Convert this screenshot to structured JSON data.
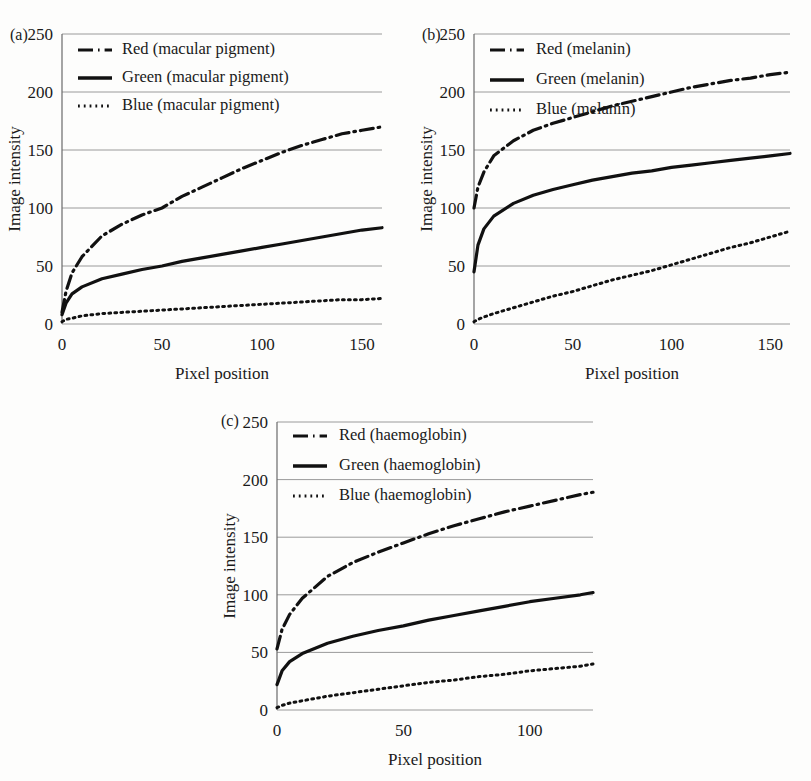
{
  "figure": {
    "background": "#fdfdfc",
    "ink": "#111111",
    "gridline_color": "#9a9a9a"
  },
  "panels": [
    {
      "id": "a",
      "label": "(a)",
      "xlabel": "Pixel position",
      "ylabel": "Image intensity",
      "yticks": [
        0,
        50,
        100,
        150,
        200,
        250
      ],
      "xticks": [
        0,
        50,
        100,
        150
      ],
      "legend": [
        {
          "label": "Red (macular pigment)",
          "style": "dashdot"
        },
        {
          "label": "Green (macular pigment)",
          "style": "solid"
        },
        {
          "label": "Blue (macular pigment)",
          "style": "dotted"
        }
      ]
    },
    {
      "id": "b",
      "label": "(b)",
      "xlabel": "Pixel position",
      "ylabel": "Image intensity",
      "yticks": [
        0,
        50,
        100,
        150,
        200,
        250
      ],
      "xticks": [
        0,
        50,
        100,
        150
      ],
      "legend": [
        {
          "label": "Red (melanin)",
          "style": "dashdot"
        },
        {
          "label": "Green (melanin)",
          "style": "solid"
        },
        {
          "label": "Blue (melanin)",
          "style": "dotted"
        }
      ]
    },
    {
      "id": "c",
      "label": "(c)",
      "xlabel": "Pixel position",
      "ylabel": "Image intensity",
      "yticks": [
        0,
        50,
        100,
        150,
        200,
        250
      ],
      "xticks": [
        0,
        50,
        100
      ],
      "legend": [
        {
          "label": "Red (haemoglobin)",
          "style": "dashdot"
        },
        {
          "label": "Green (haemoglobin)",
          "style": "solid"
        },
        {
          "label": "Blue (haemoglobin)",
          "style": "dotted"
        }
      ]
    }
  ],
  "chart_data": [
    {
      "type": "line",
      "panel": "a",
      "title": "(a) Macular pigment",
      "xlabel": "Pixel position",
      "ylabel": "Image intensity",
      "xlim": [
        0,
        160
      ],
      "ylim": [
        0,
        250
      ],
      "xticks": [
        0,
        50,
        100,
        150
      ],
      "yticks": [
        0,
        50,
        100,
        150,
        200,
        250
      ],
      "grid": true,
      "legend_position": "top-left-inside",
      "x": [
        0,
        2,
        5,
        10,
        20,
        30,
        40,
        50,
        60,
        70,
        80,
        90,
        100,
        110,
        120,
        130,
        140,
        150,
        160
      ],
      "series": [
        {
          "name": "Red (macular pigment)",
          "style": "dashdot",
          "values": [
            10,
            28,
            44,
            58,
            76,
            86,
            94,
            100,
            110,
            118,
            126,
            134,
            141,
            148,
            154,
            159,
            164,
            167,
            170
          ]
        },
        {
          "name": "Green (macular pigment)",
          "style": "solid",
          "values": [
            8,
            18,
            26,
            32,
            39,
            43,
            47,
            50,
            54,
            57,
            60,
            63,
            66,
            69,
            72,
            75,
            78,
            81,
            83
          ]
        },
        {
          "name": "Blue (macular pigment)",
          "style": "dotted",
          "values": [
            2,
            4,
            5,
            7,
            9,
            10,
            11,
            12,
            13,
            14,
            15,
            16,
            17,
            18,
            19,
            20,
            21,
            21,
            22
          ]
        }
      ]
    },
    {
      "type": "line",
      "panel": "b",
      "title": "(b) Melanin",
      "xlabel": "Pixel position",
      "ylabel": "Image intensity",
      "xlim": [
        0,
        160
      ],
      "ylim": [
        0,
        250
      ],
      "xticks": [
        0,
        50,
        100,
        150
      ],
      "yticks": [
        0,
        50,
        100,
        150,
        200,
        250
      ],
      "grid": true,
      "legend_position": "top-left-inside",
      "x": [
        0,
        2,
        5,
        10,
        20,
        30,
        40,
        50,
        60,
        70,
        80,
        90,
        100,
        110,
        120,
        130,
        140,
        150,
        160
      ],
      "series": [
        {
          "name": "Red (melanin)",
          "style": "dashdot",
          "values": [
            100,
            118,
            131,
            145,
            158,
            167,
            173,
            178,
            183,
            188,
            192,
            196,
            200,
            204,
            207,
            210,
            212,
            215,
            217
          ]
        },
        {
          "name": "Green (melanin)",
          "style": "solid",
          "values": [
            45,
            68,
            82,
            93,
            104,
            111,
            116,
            120,
            124,
            127,
            130,
            132,
            135,
            137,
            139,
            141,
            143,
            145,
            147
          ]
        },
        {
          "name": "Blue (melanin)",
          "style": "dotted",
          "values": [
            2,
            4,
            6,
            9,
            14,
            19,
            24,
            28,
            33,
            38,
            42,
            46,
            51,
            56,
            61,
            66,
            70,
            75,
            80
          ]
        }
      ]
    },
    {
      "type": "line",
      "panel": "c",
      "title": "(c) Haemoglobin",
      "xlabel": "Pixel position",
      "ylabel": "Image intensity",
      "xlim": [
        0,
        125
      ],
      "ylim": [
        0,
        250
      ],
      "xticks": [
        0,
        50,
        100
      ],
      "yticks": [
        0,
        50,
        100,
        150,
        200,
        250
      ],
      "grid": true,
      "legend_position": "top-left-inside",
      "x": [
        0,
        2,
        5,
        10,
        20,
        30,
        40,
        50,
        60,
        70,
        80,
        90,
        100,
        110,
        120,
        125
      ],
      "series": [
        {
          "name": "Red (haemoglobin)",
          "style": "dashdot",
          "values": [
            53,
            70,
            83,
            97,
            116,
            128,
            137,
            145,
            153,
            160,
            166,
            172,
            177,
            182,
            187,
            189
          ]
        },
        {
          "name": "Green (haemoglobin)",
          "style": "solid",
          "values": [
            22,
            34,
            42,
            49,
            58,
            64,
            69,
            73,
            78,
            82,
            86,
            90,
            94,
            97,
            100,
            102
          ]
        },
        {
          "name": "Blue (haemoglobin)",
          "style": "dotted",
          "values": [
            2,
            4,
            6,
            8,
            12,
            15,
            18,
            21,
            24,
            26,
            29,
            31,
            34,
            36,
            38,
            40
          ]
        }
      ]
    }
  ]
}
